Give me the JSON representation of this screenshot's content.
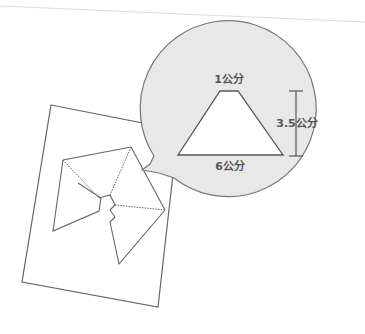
{
  "diagram": {
    "callout": {
      "fill_color": "#e8e8e8",
      "stroke_color": "#777777",
      "trapezoid": {
        "top_label": "1公分",
        "bottom_label": "6公分",
        "height_label": "3.5公分"
      }
    },
    "paper": {
      "fill_color": "#ffffff",
      "stroke_color": "#666666"
    },
    "top_rule_color": "#dddddd"
  }
}
